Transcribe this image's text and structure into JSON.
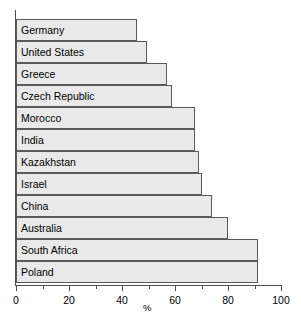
{
  "chart_data": {
    "type": "bar",
    "orientation": "horizontal",
    "title": "",
    "xlabel": "%",
    "ylabel": "",
    "xlim": [
      0,
      100
    ],
    "grid": false,
    "legend": null,
    "categories": [
      "Germany",
      "United States",
      "Greece",
      "Czech Republic",
      "Morocco",
      "India",
      "Kazakhstan",
      "Israel",
      "China",
      "Australia",
      "South Africa",
      "Poland"
    ],
    "values": [
      45.5,
      49.5,
      57,
      59,
      67.5,
      67.5,
      69,
      70,
      74,
      80,
      91.5,
      91.5
    ],
    "tick_labels": [
      "0",
      "20",
      "40",
      "60",
      "80",
      "100"
    ],
    "tick_values": [
      0,
      20,
      40,
      60,
      80,
      100
    ],
    "minor_tick_values": [
      10,
      30,
      50,
      70,
      90
    ],
    "bar_fill_color": "#e9e9e9",
    "bar_border_color": "#5a5a5a",
    "axis_color": "#4d4d4d"
  }
}
